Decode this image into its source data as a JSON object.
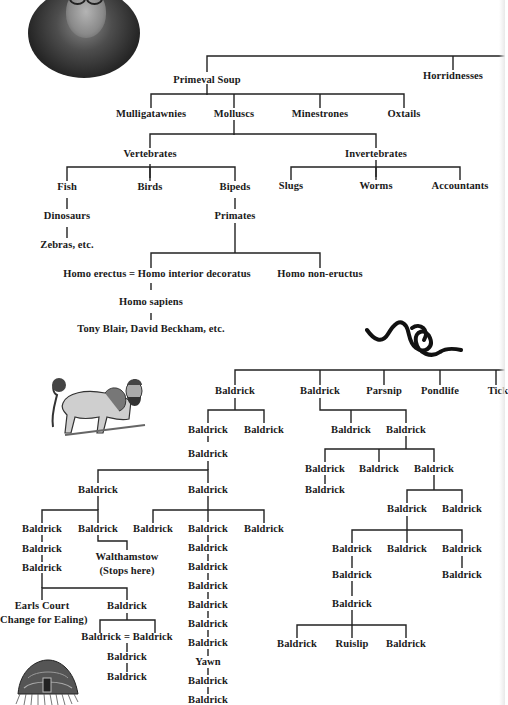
{
  "diagram": {
    "illustrations": [
      {
        "name": "portrait-photo",
        "description": "oval black-and-white portrait of a man with round glasses"
      },
      {
        "name": "worm-illustration",
        "description": "black squiggly knotted worm"
      },
      {
        "name": "man-headed-lion-illustration",
        "description": "engraving of a lion with a bearded human head"
      },
      {
        "name": "jellyfish-illustration",
        "description": "engraving of a jellyfish"
      }
    ],
    "upper_tree": {
      "root_children": [
        "Primeval Soup",
        "Horridnesses"
      ],
      "primeval_soup_children": [
        "Mulligatawnies",
        "Molluscs",
        "Minestrones",
        "Oxtails"
      ],
      "molluscs_children": [
        "Vertebrates",
        "Invertebrates"
      ],
      "vertebrates_children": [
        "Fish",
        "Birds",
        "Bipeds"
      ],
      "invertebrates_children": [
        "Slugs",
        "Worms",
        "Accountants"
      ],
      "fish_line": [
        "Dinosaurs",
        "Zebras, etc."
      ],
      "bipeds_line": [
        "Primates"
      ],
      "primates_children": [
        "Homo erectus = Homo interior decoratus",
        "Homo non-eructus"
      ],
      "erectus_line": [
        "Homo sapiens",
        "Tony Blair, David Beckham, etc."
      ]
    },
    "lower_tree": {
      "top_row": [
        "Baldrick",
        "Baldrick",
        "Parsnip",
        "Pondlife",
        "Tick"
      ],
      "left_branch": {
        "level1": [
          "Baldrick",
          "Baldrick"
        ],
        "level2": "Baldrick",
        "level3": [
          "Baldrick",
          "Baldrick"
        ],
        "a_children": [
          "Baldrick",
          "Baldrick"
        ],
        "a1_line": [
          "Baldrick",
          "Baldrick"
        ],
        "a2_child": [
          "Walthamstow",
          "(Stops here)"
        ],
        "a_split": [
          "Earls Court",
          "(Change for Ealing)"
        ],
        "a_split_right": "Baldrick",
        "marriage": "Baldrick = Baldrick",
        "marriage_line": [
          "Baldrick",
          "Baldrick"
        ],
        "b_children": [
          "Baldrick",
          "Baldrick",
          "Baldrick"
        ],
        "b_line": [
          "Baldrick",
          "Baldrick",
          "Baldrick",
          "Baldrick",
          "Baldrick",
          "Baldrick",
          "Yawn",
          "Baldrick",
          "Baldrick"
        ]
      },
      "right_branch": {
        "level1": [
          "Baldrick",
          "Baldrick"
        ],
        "level2": [
          "Baldrick",
          "Baldrick",
          "Baldrick"
        ],
        "level2_line": "Baldrick",
        "level3": [
          "Baldrick",
          "Baldrick"
        ],
        "level4": [
          "Baldrick",
          "Baldrick",
          "Baldrick"
        ],
        "level4_left_line": [
          "Baldrick",
          "Baldrick"
        ],
        "level4_right_line": "Baldrick",
        "level5": [
          "Baldrick",
          "Ruislip",
          "Baldrick"
        ]
      }
    }
  }
}
